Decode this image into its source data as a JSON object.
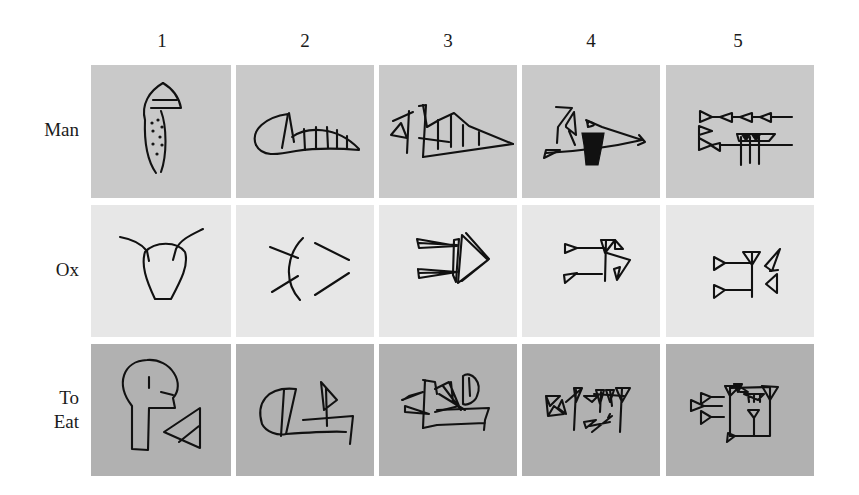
{
  "figure": {
    "columns": [
      {
        "label": "1"
      },
      {
        "label": "2"
      },
      {
        "label": "3"
      },
      {
        "label": "4"
      },
      {
        "label": "5"
      }
    ],
    "rows": [
      {
        "label": "Man",
        "background": "#c9c9c9"
      },
      {
        "label": "Ox",
        "background": "#e7e7e7"
      },
      {
        "label": "To Eat",
        "label_line1": "To",
        "label_line2": "Eat",
        "background": "#b1b1b1"
      }
    ],
    "cells": [
      [
        "pictograph-man-head",
        "rotated-man-sign",
        "early-cuneiform-man",
        "middle-cuneiform-man",
        "late-cuneiform-man"
      ],
      [
        "pictograph-ox-head",
        "rotated-ox-sign",
        "early-cuneiform-ox",
        "middle-cuneiform-ox",
        "late-cuneiform-ox"
      ],
      [
        "pictograph-head-and-bowl",
        "rotated-eat-sign",
        "early-cuneiform-eat",
        "middle-cuneiform-eat",
        "late-cuneiform-eat"
      ]
    ]
  }
}
